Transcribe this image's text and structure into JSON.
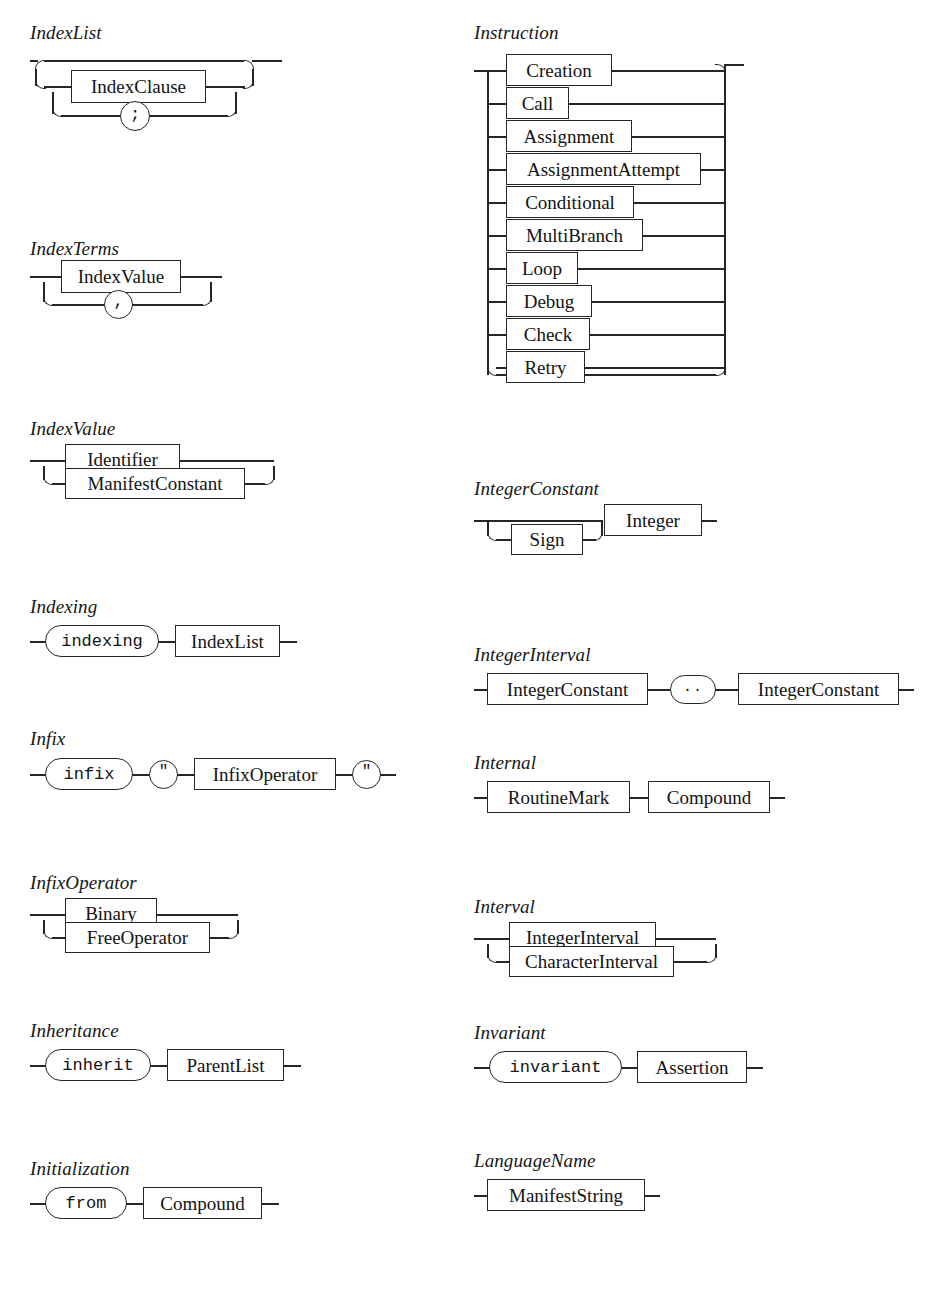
{
  "page": {
    "kind": "syntax-railroad-diagrams",
    "columns": 2,
    "productions_count": 16
  },
  "productions": [
    {
      "id": "IndexList",
      "name": "IndexList",
      "column": "left",
      "pattern": "optional-repetition-with-separator",
      "items": [
        {
          "kind": "nonterminal",
          "text": "IndexClause"
        },
        {
          "kind": "terminal-symbol",
          "text": ";"
        }
      ]
    },
    {
      "id": "IndexTerms",
      "name": "IndexTerms",
      "column": "left",
      "pattern": "repetition-with-separator",
      "items": [
        {
          "kind": "nonterminal",
          "text": "IndexValue"
        },
        {
          "kind": "terminal-symbol",
          "text": ","
        }
      ]
    },
    {
      "id": "IndexValue",
      "name": "IndexValue",
      "column": "left",
      "pattern": "choice",
      "items": [
        {
          "kind": "nonterminal",
          "text": "Identifier"
        },
        {
          "kind": "nonterminal",
          "text": "ManifestConstant"
        }
      ]
    },
    {
      "id": "Indexing",
      "name": "Indexing",
      "column": "left",
      "pattern": "sequence",
      "items": [
        {
          "kind": "terminal-keyword",
          "text": "indexing"
        },
        {
          "kind": "nonterminal",
          "text": "IndexList"
        }
      ]
    },
    {
      "id": "Infix",
      "name": "Infix",
      "column": "left",
      "pattern": "sequence",
      "items": [
        {
          "kind": "terminal-keyword",
          "text": "infix"
        },
        {
          "kind": "terminal-symbol",
          "text": "\""
        },
        {
          "kind": "nonterminal",
          "text": "InfixOperator"
        },
        {
          "kind": "terminal-symbol",
          "text": "\""
        }
      ]
    },
    {
      "id": "InfixOperator",
      "name": "InfixOperator",
      "column": "left",
      "pattern": "choice",
      "items": [
        {
          "kind": "nonterminal",
          "text": "Binary"
        },
        {
          "kind": "nonterminal",
          "text": "FreeOperator"
        }
      ]
    },
    {
      "id": "Inheritance",
      "name": "Inheritance",
      "column": "left",
      "pattern": "sequence",
      "items": [
        {
          "kind": "terminal-keyword",
          "text": "inherit"
        },
        {
          "kind": "nonterminal",
          "text": "ParentList"
        }
      ]
    },
    {
      "id": "Initialization",
      "name": "Initialization",
      "column": "left",
      "pattern": "sequence",
      "items": [
        {
          "kind": "terminal-keyword",
          "text": "from"
        },
        {
          "kind": "nonterminal",
          "text": "Compound"
        }
      ]
    },
    {
      "id": "Instruction",
      "name": "Instruction",
      "column": "right",
      "pattern": "choice",
      "items": [
        {
          "kind": "nonterminal",
          "text": "Creation"
        },
        {
          "kind": "nonterminal",
          "text": "Call"
        },
        {
          "kind": "nonterminal",
          "text": "Assignment"
        },
        {
          "kind": "nonterminal",
          "text": "AssignmentAttempt"
        },
        {
          "kind": "nonterminal",
          "text": "Conditional"
        },
        {
          "kind": "nonterminal",
          "text": "MultiBranch"
        },
        {
          "kind": "nonterminal",
          "text": "Loop"
        },
        {
          "kind": "nonterminal",
          "text": "Debug"
        },
        {
          "kind": "nonterminal",
          "text": "Check"
        },
        {
          "kind": "nonterminal",
          "text": "Retry"
        }
      ]
    },
    {
      "id": "IntegerConstant",
      "name": "IntegerConstant",
      "column": "right",
      "pattern": "optional-then-sequence",
      "items": [
        {
          "kind": "nonterminal",
          "text": "Sign",
          "optional": true
        },
        {
          "kind": "nonterminal",
          "text": "Integer"
        }
      ]
    },
    {
      "id": "IntegerInterval",
      "name": "IntegerInterval",
      "column": "right",
      "pattern": "sequence",
      "items": [
        {
          "kind": "nonterminal",
          "text": "IntegerConstant"
        },
        {
          "kind": "terminal-symbol",
          "text": ".."
        },
        {
          "kind": "nonterminal",
          "text": "IntegerConstant"
        }
      ]
    },
    {
      "id": "Internal",
      "name": "Internal",
      "column": "right",
      "pattern": "sequence",
      "items": [
        {
          "kind": "nonterminal",
          "text": "RoutineMark"
        },
        {
          "kind": "nonterminal",
          "text": "Compound"
        }
      ]
    },
    {
      "id": "Interval",
      "name": "Interval",
      "column": "right",
      "pattern": "choice",
      "items": [
        {
          "kind": "nonterminal",
          "text": "IntegerInterval"
        },
        {
          "kind": "nonterminal",
          "text": "CharacterInterval"
        }
      ]
    },
    {
      "id": "Invariant",
      "name": "Invariant",
      "column": "right",
      "pattern": "sequence",
      "items": [
        {
          "kind": "terminal-keyword",
          "text": "invariant"
        },
        {
          "kind": "nonterminal",
          "text": "Assertion"
        }
      ]
    },
    {
      "id": "LanguageName",
      "name": "LanguageName",
      "column": "right",
      "pattern": "single",
      "items": [
        {
          "kind": "nonterminal",
          "text": "ManifestString"
        }
      ]
    }
  ],
  "style": {
    "line_color": "#262626",
    "text_color": "#131313",
    "background": "#ffffff"
  }
}
